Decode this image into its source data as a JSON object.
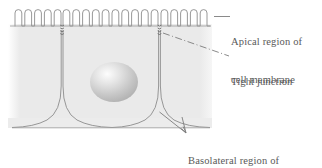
{
  "figure": {
    "background_color": "#ffffff",
    "tissue_fill": "#e9e9e9",
    "tissue_edge_fill": "#f3f3f3",
    "line_color": "#8a8a8a",
    "text_color": "#595959"
  },
  "labels": {
    "apical": {
      "line1": "Apical region of",
      "line2": "cell membrane",
      "leader": "solid-short-dash"
    },
    "tight_junction": {
      "line1": "Tight junction",
      "line2": "",
      "leader": "dash-dot"
    },
    "basolateral": {
      "line1": "Basolateral region of",
      "line2": "cell membrane",
      "leader": "two-arrow-lines"
    }
  },
  "structures": {
    "microvilli": {
      "name": "microvilli",
      "count": 20,
      "period": 9.8,
      "top_y": 10,
      "base_y": 26,
      "start_x": 15,
      "end_x": 211
    },
    "tight_junctions": {
      "name": "tight-junction-beads",
      "positions_x": [
        62,
        160
      ],
      "top_y": 24,
      "bottom_y": 36,
      "bead_count": 4
    },
    "nucleus": {
      "name": "nucleus",
      "center_x": 114,
      "center_y": 82,
      "radius_x": 24,
      "radius_y": 20,
      "highlight_x": 105,
      "highlight_y": 73
    },
    "cell_walls": {
      "name": "lateral-membranes",
      "positions_x": [
        62,
        160
      ],
      "top_y": 26,
      "flare_y": 122
    },
    "basal_lamina": {
      "name": "basal-surface",
      "y": 128,
      "start_x": 12,
      "end_x": 211
    },
    "tissue_region": {
      "left_x": 8,
      "right_x": 211,
      "top_y": 24,
      "bottom_y": 126
    }
  }
}
